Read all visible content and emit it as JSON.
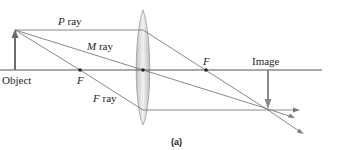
{
  "figure": {
    "caption": "(a)",
    "colors": {
      "axis": "#555555",
      "ray": "#7a7a7a",
      "arrow": "#6d6d6d",
      "lens_fill": "#d9d9d9",
      "lens_edge": "#9a9a9a",
      "dot": "#222222",
      "text": "#231f20"
    }
  },
  "labels": {
    "object": "Object",
    "image": "Image",
    "focal_left": "F",
    "focal_right": "F",
    "p_ray_letter": "P",
    "p_ray_word": " ray",
    "m_ray_letter": "M",
    "m_ray_word": " ray",
    "f_ray_letter": "F",
    "f_ray_word": " ray"
  },
  "geometry": {
    "axis_y": 70,
    "object_x": 15,
    "object_top_y": 30,
    "lens_x": 143,
    "focal_left_x": 80,
    "focal_right_x": 206,
    "image_x": 268,
    "image_bottom_y": 108
  }
}
